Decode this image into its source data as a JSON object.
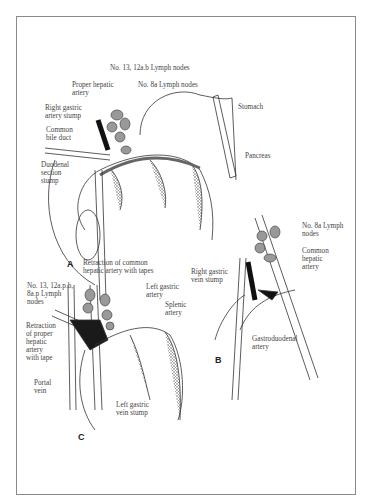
{
  "figure": {
    "panels": [
      {
        "id": "A",
        "labels": {
          "lymph_13_12ab": "No. 13, 12a.b Lymph nodes",
          "proper_hepatic": "Proper hepatic\nartery",
          "lymph_8a": "No. 8a Lymph nodes",
          "stomach": "Stomach",
          "right_gastric_artery": "Right gastric\nartery stump",
          "common_bile": "Common\nbile duct",
          "pancreas": "Pancreas",
          "duodenal": "Duodenal\nsection\nstump"
        }
      },
      {
        "id": "B",
        "labels": {
          "lymph_8a": "No. 8a Lymph\nnodes",
          "common_hepatic": "Common\nhepatic\nartery",
          "right_gastric_vein": "Right gastric\nvein stump",
          "gastroduodenal": "Gastroduodenal\nartery"
        }
      },
      {
        "id": "C",
        "labels": {
          "retraction_common": "Retraction of common\nhepatic artery with tapes",
          "lymph_13_12ap": "No. 13, 12a.p.b,\n8a.p Lymph\nnodes",
          "left_gastric_artery": "Left gastric\nartery",
          "splenic": "Splenic\nartery",
          "retraction_proper": "Retraction\nof proper\nhepatic\nartery\nwith tape",
          "portal": "Portal\nvein",
          "left_gastric_vein": "Left gastric\nvein stump"
        }
      }
    ]
  }
}
